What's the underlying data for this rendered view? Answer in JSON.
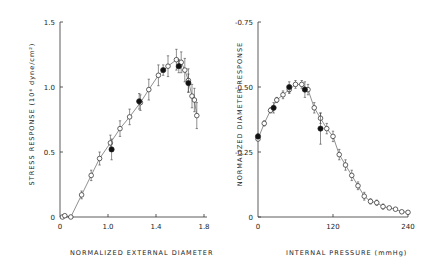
{
  "chart_data": [
    {
      "type": "scatter",
      "title": "",
      "xlabel": "NORMALIZED EXTERNAL DIAMETER",
      "ylabel": "STRESS RESPONSE (10^6 dyne/cm^2)",
      "xticks": [
        "0",
        "1.0",
        "1.4",
        "1.8"
      ],
      "yticks": [
        "0",
        "0.5",
        "1.0",
        "1.5"
      ],
      "xlim": [
        0.6,
        1.8
      ],
      "ylim": [
        0,
        1.5
      ],
      "x_axis_break": "0 label at origin, scale continues from ~0.6",
      "grid": false,
      "series": [
        {
          "name": "open circles (with error bars, connected line)",
          "marker": "open-circle",
          "x": [
            0.62,
            0.64,
            0.69,
            0.78,
            0.86,
            0.93,
            1.02,
            1.1,
            1.18,
            1.27,
            1.34,
            1.42,
            1.5,
            1.57,
            1.61,
            1.64,
            1.67,
            1.7,
            1.72,
            1.74
          ],
          "y": [
            0.0,
            0.01,
            0.0,
            0.17,
            0.32,
            0.45,
            0.57,
            0.68,
            0.77,
            0.88,
            0.98,
            1.09,
            1.16,
            1.21,
            1.19,
            1.13,
            1.05,
            0.93,
            0.9,
            0.78
          ],
          "err": [
            0,
            0,
            0,
            0.03,
            0.04,
            0.05,
            0.06,
            0.06,
            0.06,
            0.06,
            0.08,
            0.08,
            0.08,
            0.08,
            0.08,
            0.09,
            0.09,
            0.09,
            0.09,
            0.1
          ]
        },
        {
          "name": "filled circles",
          "marker": "filled-circle",
          "x": [
            1.03,
            1.26,
            1.46,
            1.59,
            1.67
          ],
          "y": [
            0.52,
            0.89,
            1.13,
            1.16,
            1.03
          ],
          "err": [
            0.08,
            0.06,
            0.04,
            0.05,
            0.07
          ]
        }
      ]
    },
    {
      "type": "scatter",
      "title": "",
      "xlabel": "INTERNAL PRESSURE (mmHg)",
      "ylabel": "NORMALIZED DIAMETER RESPONSE",
      "xticks": [
        "0",
        "120",
        "240"
      ],
      "yticks": [
        "0",
        "-0.25",
        "-0.50",
        "-0.75"
      ],
      "xlim": [
        0,
        240
      ],
      "ylim": [
        0,
        -0.75
      ],
      "grid": false,
      "series": [
        {
          "name": "open circles (with error bars, connected line)",
          "marker": "open-circle",
          "x": [
            0,
            10,
            20,
            30,
            40,
            50,
            60,
            70,
            80,
            90,
            100,
            110,
            120,
            130,
            140,
            150,
            160,
            170,
            180,
            190,
            200,
            210,
            220,
            230,
            240
          ],
          "y": [
            -0.3,
            -0.36,
            -0.41,
            -0.45,
            -0.47,
            -0.49,
            -0.51,
            -0.51,
            -0.49,
            -0.42,
            -0.38,
            -0.34,
            -0.31,
            -0.24,
            -0.2,
            -0.16,
            -0.12,
            -0.08,
            -0.06,
            -0.055,
            -0.04,
            -0.035,
            -0.03,
            -0.02,
            -0.018
          ],
          "err": [
            0,
            0.01,
            0.01,
            0.01,
            0.015,
            0.015,
            0.015,
            0.015,
            0.02,
            0.02,
            0.02,
            0.02,
            0.02,
            0.02,
            0.02,
            0.02,
            0.015,
            0.015,
            0.01,
            0.01,
            0.01,
            0.005,
            0.005,
            0.005,
            0.005
          ]
        },
        {
          "name": "filled circles",
          "marker": "filled-circle",
          "x": [
            0,
            25,
            50,
            75,
            100
          ],
          "y": [
            -0.31,
            -0.42,
            -0.5,
            -0.49,
            -0.34
          ],
          "err": [
            0.01,
            0.02,
            0.02,
            0.03,
            0.06
          ]
        }
      ]
    }
  ],
  "labels": {
    "left_xlabel": "NORMALIZED EXTERNAL DIAMETER",
    "right_xlabel": "INTERNAL PRESSURE (mmHg)",
    "left_ylabel": "STRESS RESPONSE (10⁶ dyne/cm²)",
    "right_ylabel": "NORMALIZED DIAMETER RESPONSE"
  }
}
